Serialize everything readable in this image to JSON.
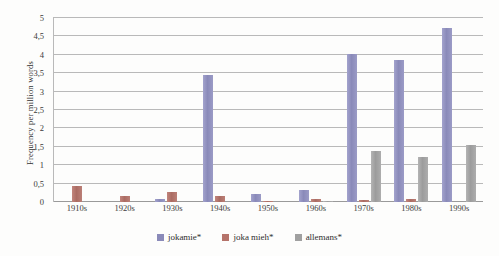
{
  "chart_data": {
    "type": "bar",
    "title": "",
    "xlabel": "",
    "ylabel": "Frequency per million words",
    "ylim": [
      0,
      5
    ],
    "ytick_step": 0.5,
    "decimal_separator": ",",
    "grid": true,
    "legend_position": "bottom",
    "categories": [
      "1910s",
      "1920s",
      "1930s",
      "1940s",
      "1950s",
      "1960s",
      "1970s",
      "1980s",
      "1990s"
    ],
    "ytick_labels": [
      "0",
      "0,5",
      "1",
      "1,5",
      "2",
      "2,5",
      "3",
      "3,5",
      "4",
      "4,5",
      "5"
    ],
    "ytick_values": [
      0,
      0.5,
      1,
      1.5,
      2,
      2.5,
      3,
      3.5,
      4,
      4.5,
      5
    ],
    "series": [
      {
        "name": "jokamie*",
        "color": "#8a8ab9",
        "values": [
          0,
          0,
          0.09,
          3.45,
          0.23,
          0.33,
          4.02,
          3.85,
          4.72
        ]
      },
      {
        "name": "joka mieh*",
        "color": "#b5736a",
        "values": [
          0.43,
          0.16,
          0.27,
          0.15,
          0.04,
          0.08,
          0.05,
          0.08,
          0
        ]
      },
      {
        "name": "allemans*",
        "color": "#a0a0a0",
        "values": [
          0,
          0,
          0,
          0,
          0,
          0.02,
          1.38,
          1.22,
          1.55
        ]
      }
    ]
  }
}
